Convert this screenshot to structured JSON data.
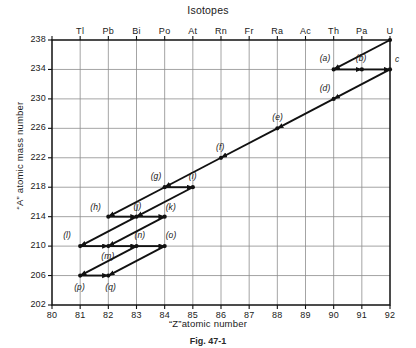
{
  "figure": {
    "title": "Isotopes",
    "caption": "Fig. 47-1",
    "xlabel": "“Z”atomic number",
    "ylabel": "“A” atomic mass number"
  },
  "chart_data": {
    "type": "scatter",
    "title": "Isotopes",
    "xlabel": "“Z”atomic number",
    "ylabel": "“A” atomic mass number",
    "xlim": [
      80,
      92
    ],
    "ylim": [
      202,
      238
    ],
    "xticks": [
      80,
      81,
      82,
      83,
      84,
      85,
      86,
      87,
      88,
      89,
      90,
      91,
      92
    ],
    "yticks": [
      202,
      206,
      210,
      214,
      218,
      222,
      226,
      230,
      234,
      238
    ],
    "grid": true,
    "legend": "none",
    "secondary_axis": {
      "position": "top",
      "label": "element symbol",
      "ticks": [
        {
          "z": 81,
          "symbol": "Tl"
        },
        {
          "z": 82,
          "symbol": "Pb"
        },
        {
          "z": 83,
          "symbol": "Bi"
        },
        {
          "z": 84,
          "symbol": "Po"
        },
        {
          "z": 85,
          "symbol": "At"
        },
        {
          "z": 86,
          "symbol": "Rn"
        },
        {
          "z": 87,
          "symbol": "Fr"
        },
        {
          "z": 88,
          "symbol": "Ra"
        },
        {
          "z": 89,
          "symbol": "Ac"
        },
        {
          "z": 90,
          "symbol": "Th"
        },
        {
          "z": 91,
          "symbol": "Pa"
        },
        {
          "z": 92,
          "symbol": "U"
        }
      ]
    },
    "points": [
      {
        "id": "a",
        "label": "(a)",
        "z": 90,
        "a": 234,
        "label_dx": -14,
        "label_dy": -11
      },
      {
        "id": "b",
        "label": "(b)",
        "z": 91,
        "a": 234,
        "label_dx": -6,
        "label_dy": -11
      },
      {
        "id": "c",
        "label": "c",
        "z": 92,
        "a": 234,
        "label_dx": 5,
        "label_dy": -10
      },
      {
        "id": "d",
        "label": "(d)",
        "z": 90,
        "a": 230,
        "label_dx": -14,
        "label_dy": -11
      },
      {
        "id": "e",
        "label": "(e)",
        "z": 88,
        "a": 226,
        "label_dx": -5,
        "label_dy": -11
      },
      {
        "id": "f",
        "label": "(f)",
        "z": 86,
        "a": 222,
        "label_dx": -5,
        "label_dy": -11
      },
      {
        "id": "g",
        "label": "(g)",
        "z": 84,
        "a": 218,
        "label_dx": -14,
        "label_dy": -11
      },
      {
        "id": "i",
        "label": "(i)",
        "z": 85,
        "a": 218,
        "label_dx": -4,
        "label_dy": -11
      },
      {
        "id": "h",
        "label": "(h)",
        "z": 82,
        "a": 214,
        "label_dx": -18,
        "label_dy": -10
      },
      {
        "id": "j",
        "label": "(j)",
        "z": 83,
        "a": 214,
        "label_dx": -3,
        "label_dy": -11
      },
      {
        "id": "k",
        "label": "(k)",
        "z": 84,
        "a": 214,
        "label_dx": 1,
        "label_dy": -10
      },
      {
        "id": "l",
        "label": "(l)",
        "z": 81,
        "a": 210,
        "label_dx": -17,
        "label_dy": -11
      },
      {
        "id": "m",
        "label": "(m)",
        "z": 82,
        "a": 210,
        "label_dx": -7,
        "label_dy": 10
      },
      {
        "id": "n",
        "label": "(n)",
        "z": 83,
        "a": 210,
        "label_dx": -2,
        "label_dy": -11
      },
      {
        "id": "o",
        "label": "(o)",
        "z": 84,
        "a": 210,
        "label_dx": 1,
        "label_dy": -11
      },
      {
        "id": "p",
        "label": "(p)",
        "z": 81,
        "a": 206,
        "label_dx": -6,
        "label_dy": 11
      },
      {
        "id": "q",
        "label": "(q)",
        "z": 82,
        "a": 206,
        "label_dx": -3,
        "label_dy": 11
      }
    ],
    "decay_arrows": [
      {
        "from": {
          "z": 92,
          "a": 238
        },
        "to": {
          "z": 90,
          "a": 234
        },
        "kind": "alpha"
      },
      {
        "from": {
          "z": 90,
          "a": 234
        },
        "to": {
          "z": 91,
          "a": 234
        },
        "kind": "beta"
      },
      {
        "from": {
          "z": 91,
          "a": 234
        },
        "to": {
          "z": 92,
          "a": 234
        },
        "kind": "beta"
      },
      {
        "from": {
          "z": 92,
          "a": 234
        },
        "to": {
          "z": 90,
          "a": 230
        },
        "kind": "alpha"
      },
      {
        "from": {
          "z": 90,
          "a": 230
        },
        "to": {
          "z": 88,
          "a": 226
        },
        "kind": "alpha"
      },
      {
        "from": {
          "z": 88,
          "a": 226
        },
        "to": {
          "z": 86,
          "a": 222
        },
        "kind": "alpha"
      },
      {
        "from": {
          "z": 86,
          "a": 222
        },
        "to": {
          "z": 84,
          "a": 218
        },
        "kind": "alpha"
      },
      {
        "from": {
          "z": 84,
          "a": 218
        },
        "to": {
          "z": 85,
          "a": 218
        },
        "kind": "beta"
      },
      {
        "from": {
          "z": 84,
          "a": 218
        },
        "to": {
          "z": 82,
          "a": 214
        },
        "kind": "alpha"
      },
      {
        "from": {
          "z": 85,
          "a": 218
        },
        "to": {
          "z": 83,
          "a": 214
        },
        "kind": "alpha"
      },
      {
        "from": {
          "z": 82,
          "a": 214
        },
        "to": {
          "z": 83,
          "a": 214
        },
        "kind": "beta"
      },
      {
        "from": {
          "z": 83,
          "a": 214
        },
        "to": {
          "z": 84,
          "a": 214
        },
        "kind": "beta"
      },
      {
        "from": {
          "z": 83,
          "a": 214
        },
        "to": {
          "z": 81,
          "a": 210
        },
        "kind": "alpha"
      },
      {
        "from": {
          "z": 84,
          "a": 214
        },
        "to": {
          "z": 82,
          "a": 210
        },
        "kind": "alpha"
      },
      {
        "from": {
          "z": 81,
          "a": 210
        },
        "to": {
          "z": 82,
          "a": 210
        },
        "kind": "beta"
      },
      {
        "from": {
          "z": 82,
          "a": 210
        },
        "to": {
          "z": 83,
          "a": 210
        },
        "kind": "beta"
      },
      {
        "from": {
          "z": 83,
          "a": 210
        },
        "to": {
          "z": 84,
          "a": 210
        },
        "kind": "beta"
      },
      {
        "from": {
          "z": 83,
          "a": 210
        },
        "to": {
          "z": 81,
          "a": 206
        },
        "kind": "alpha"
      },
      {
        "from": {
          "z": 84,
          "a": 210
        },
        "to": {
          "z": 82,
          "a": 206
        },
        "kind": "alpha"
      },
      {
        "from": {
          "z": 81,
          "a": 206
        },
        "to": {
          "z": 82,
          "a": 206
        },
        "kind": "beta"
      }
    ]
  }
}
